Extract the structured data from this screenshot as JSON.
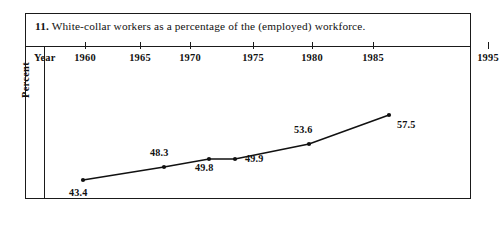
{
  "figure": {
    "number": "11.",
    "caption": "White-collar workers as a percentage of the (employed) workforce.",
    "year_axis_label": "Year",
    "percent_axis_label": "Percent"
  },
  "chart_data": {
    "type": "line",
    "title": "11. White-collar workers as a percentage of the (employed) workforce.",
    "xlabel": "Year",
    "ylabel": "Percent",
    "grid": false,
    "legend": null,
    "x_tick_labels": [
      "1960",
      "1965",
      "1970",
      "1975",
      "1980",
      "1985",
      "1995"
    ],
    "x": [
      1960,
      1970,
      1975,
      1980,
      1985,
      1995
    ],
    "values": [
      43.4,
      48.3,
      49.8,
      49.9,
      53.6,
      57.5
    ],
    "point_labels": [
      "43.4",
      "48.3",
      "49.8",
      "49.9",
      "53.6",
      "57.5"
    ],
    "ylim": [
      40,
      60
    ],
    "xlim": [
      1958,
      1997
    ],
    "marker": "dot",
    "line_color": "#111111",
    "marker_color": "#111111"
  },
  "ticks": [
    {
      "label": "1960",
      "x": 59
    },
    {
      "label": "1965",
      "x": 114
    },
    {
      "label": "1970",
      "x": 164
    },
    {
      "label": "1975",
      "x": 227
    },
    {
      "label": "1980",
      "x": 286
    },
    {
      "label": "1985",
      "x": 347
    },
    {
      "label": "1995",
      "x": 462
    }
  ],
  "points": [
    {
      "label": "43.4",
      "cx": 57,
      "cy": 134,
      "lx": 43,
      "ly": 141
    },
    {
      "label": "48.3",
      "cx": 138,
      "cy": 121,
      "lx": 124,
      "ly": 101
    },
    {
      "label": "49.8",
      "cx": 183,
      "cy": 113,
      "lx": 169,
      "ly": 116
    },
    {
      "label": "49.9",
      "cx": 209,
      "cy": 113,
      "lx": 219,
      "ly": 107
    },
    {
      "label": "53.6",
      "cx": 283,
      "cy": 98,
      "lx": 268,
      "ly": 78
    },
    {
      "label": "57.5",
      "cx": 363,
      "cy": 69,
      "lx": 371,
      "ly": 73
    }
  ],
  "colors": {
    "ink": "#111111",
    "frame": "#1a1a1a",
    "paper": "#ffffff"
  }
}
